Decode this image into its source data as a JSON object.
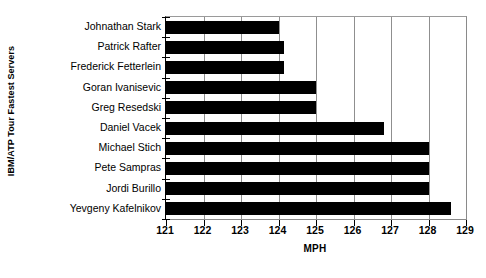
{
  "chart_data": {
    "type": "bar",
    "orientation": "horizontal",
    "title": "",
    "xlabel": "MPH",
    "ylabel": "IBM/ATP Tour Fastest Servers",
    "xlim": [
      121,
      129
    ],
    "xticks": [
      121,
      122,
      123,
      124,
      125,
      126,
      127,
      128,
      129
    ],
    "grid": true,
    "legend": false,
    "bar_color": "#000000",
    "categories": [
      "Johnathan Stark",
      "Patrick Rafter",
      "Frederick Fetterlein",
      "Goran Ivanisevic",
      "Greg Resedski",
      "Daniel Vacek",
      "Michael Stich",
      "Pete Sampras",
      "Jordi Burillo",
      "Yevgeny Kafelnikov"
    ],
    "values": [
      124.0,
      124.15,
      124.15,
      125.0,
      125.0,
      126.8,
      128.0,
      128.0,
      128.0,
      128.6
    ]
  }
}
